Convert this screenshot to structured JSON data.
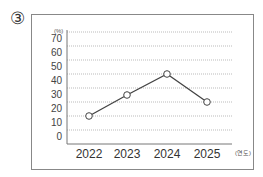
{
  "question_number": "③",
  "chart_data": {
    "type": "line",
    "title": "",
    "xlabel": "(연도)",
    "ylabel": "(%)",
    "categories": [
      "2022",
      "2023",
      "2024",
      "2025"
    ],
    "values": [
      10,
      25,
      40,
      20
    ],
    "y_ticks": [
      "70",
      "60",
      "50",
      "40",
      "30",
      "20",
      "10",
      "0"
    ],
    "ylim": [
      0,
      70
    ],
    "grid": true,
    "marker": "open-circle",
    "line_color": "#444444"
  }
}
